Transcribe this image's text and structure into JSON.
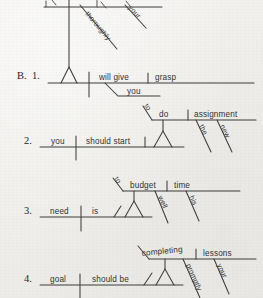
{
  "page": {
    "background_color": "#f0efec",
    "ink_color": "#3a3a3c",
    "kind": "sentence-diagram-worksheet"
  },
  "section_label": "B.",
  "top_partial_diagram": {
    "note": "diagram cut off at top edge of page",
    "modifiers": [
      "thoroughly",
      "your"
    ]
  },
  "exercises": [
    {
      "number": "1.",
      "subject": "",
      "verb": "will give",
      "indirect_object": "you",
      "direct_object": "grasp",
      "modifiers": []
    },
    {
      "number": "2.",
      "subject": "you",
      "verb": "should start",
      "infinitive_marker": "to",
      "infinitive_verb": "do",
      "infinitive_object": "assignment",
      "modifiers": [
        "the",
        "new"
      ]
    },
    {
      "number": "3.",
      "subject": "need",
      "verb": "is",
      "infinitive_marker": "to",
      "infinitive_verb": "budget",
      "infinitive_object": "time",
      "modifiers": [
        "well",
        "his"
      ]
    },
    {
      "number": "4.",
      "subject": "goal",
      "verb": "should be",
      "gerund_verb": "completing",
      "gerund_object": "lessons",
      "modifiers": [
        "promptly",
        "your"
      ]
    }
  ]
}
